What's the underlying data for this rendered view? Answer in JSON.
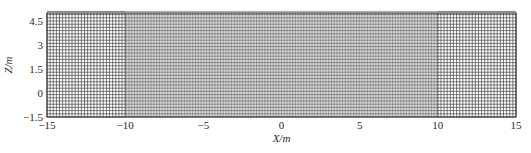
{
  "chart_data": {
    "type": "heatmap",
    "title": "",
    "xlabel": "X/m",
    "ylabel": "Z/m",
    "xlim": [
      -15,
      15
    ],
    "ylim": [
      -1.5,
      5.0
    ],
    "x_ticks": [
      -15,
      -10,
      -5,
      0,
      5,
      10,
      15
    ],
    "x_tick_labels": [
      "−15",
      "−10",
      "−5",
      "0",
      "5",
      "10",
      "15"
    ],
    "y_ticks": [
      -1.5,
      0,
      1.5,
      3,
      4.5
    ],
    "y_tick_labels": [
      "−1.5",
      "0",
      "1.5",
      "3",
      "4.5"
    ],
    "grid": true,
    "legend": null,
    "regions": [
      {
        "name": "left-coarse",
        "x_range": [
          -15,
          -10
        ],
        "dx": 0.2,
        "dz": 0.2
      },
      {
        "name": "center-fine",
        "x_range": [
          -10,
          10
        ],
        "dx": 0.1,
        "dz": 0.2
      },
      {
        "name": "right-coarse",
        "x_range": [
          10,
          15
        ],
        "dx": 0.2,
        "dz": 0.2
      }
    ],
    "line_color": "#333333"
  }
}
